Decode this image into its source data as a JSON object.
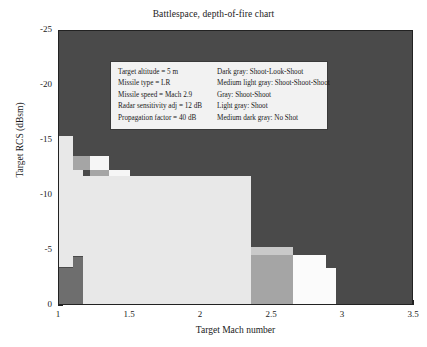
{
  "chart_data": {
    "type": "heatmap",
    "title": "Battlespace, depth-of-fire chart",
    "xlabel": "Target Mach number",
    "ylabel": "Target RCS (dBsm)",
    "xlim": [
      1,
      3.5
    ],
    "ylim": [
      -25,
      0
    ],
    "y_inverted": true,
    "grid": false,
    "xticks": [
      "1",
      "1.5",
      "2",
      "2.5",
      "3",
      "3.5"
    ],
    "xtick_values": [
      1,
      1.5,
      2,
      2.5,
      3,
      3.5
    ],
    "yticks": [
      "-25",
      "-20",
      "-15",
      "-10",
      "-5",
      "0"
    ],
    "ytick_values": [
      -25,
      -20,
      -15,
      -10,
      -5,
      0
    ],
    "legend_position": "upper-center-inside",
    "categories": [
      {
        "key": "shoot-look-shoot",
        "label": "Dark gray: Shoot-Look-Shoot",
        "color": "#4a4a4a"
      },
      {
        "key": "shoot-shoot-shoot",
        "label": "Medium light gray: Shoot-Shoot-Shoot",
        "color": "#c9c9c9"
      },
      {
        "key": "shoot-shoot",
        "label": "Gray: Shoot-Shoot",
        "color": "#a5a5a5"
      },
      {
        "key": "shoot",
        "label": "Light gray: Shoot",
        "color": "#e8e8e8"
      },
      {
        "key": "no-shot",
        "label": "Medium dark gray: No Shot",
        "color": "#6e6e6e"
      }
    ],
    "cells": [
      {
        "x0": 1.0,
        "x1": 1.1,
        "y0": -15.5,
        "y1": -13.6,
        "color": "#e8e8e8"
      },
      {
        "x0": 1.0,
        "x1": 1.1,
        "y0": -13.6,
        "y1": -3.5,
        "color": "#e8e8e8"
      },
      {
        "x0": 1.0,
        "x1": 1.1,
        "y0": -3.5,
        "y1": 0.0,
        "color": "#6e6e6e"
      },
      {
        "x0": 1.1,
        "x1": 1.17,
        "y0": -13.6,
        "y1": -4.5,
        "color": "#e8e8e8"
      },
      {
        "x0": 1.1,
        "x1": 1.17,
        "y0": -4.5,
        "y1": 0.0,
        "color": "#6e6e6e"
      },
      {
        "x0": 1.1,
        "x1": 1.22,
        "y0": -13.6,
        "y1": -12.4,
        "color": "#a5a5a5"
      },
      {
        "x0": 1.22,
        "x1": 1.35,
        "y0": -13.6,
        "y1": -12.4,
        "color": "#f6f6f6"
      },
      {
        "x0": 1.22,
        "x1": 1.35,
        "y0": -12.4,
        "y1": -11.2,
        "color": "#a5a5a5"
      },
      {
        "x0": 1.35,
        "x1": 1.5,
        "y0": -12.4,
        "y1": -11.2,
        "color": "#f6f6f6"
      },
      {
        "x0": 1.35,
        "x1": 1.5,
        "y0": -11.2,
        "y1": -10.0,
        "color": "#a5a5a5"
      },
      {
        "x0": 1.5,
        "x1": 1.66,
        "y0": -11.2,
        "y1": -10.0,
        "color": "#f6f6f6"
      },
      {
        "x0": 1.5,
        "x1": 1.66,
        "y0": -10.0,
        "y1": -8.9,
        "color": "#a5a5a5"
      },
      {
        "x0": 1.66,
        "x1": 1.84,
        "y0": -10.0,
        "y1": -8.9,
        "color": "#f6f6f6"
      },
      {
        "x0": 1.66,
        "x1": 1.84,
        "y0": -8.9,
        "y1": -7.7,
        "color": "#a5a5a5"
      },
      {
        "x0": 1.84,
        "x1": 2.03,
        "y0": -8.9,
        "y1": -7.7,
        "color": "#f6f6f6"
      },
      {
        "x0": 1.84,
        "x1": 2.03,
        "y0": -7.7,
        "y1": -6.5,
        "color": "#a5a5a5"
      },
      {
        "x0": 2.03,
        "x1": 2.22,
        "y0": -7.7,
        "y1": -6.5,
        "color": "#f6f6f6"
      },
      {
        "x0": 2.03,
        "x1": 2.22,
        "y0": -6.5,
        "y1": -5.4,
        "color": "#a5a5a5"
      },
      {
        "x0": 2.22,
        "x1": 2.35,
        "y0": -6.5,
        "y1": -5.4,
        "color": "#f6f6f6"
      },
      {
        "x0": 1.17,
        "x1": 2.35,
        "y0": -11.8,
        "y1": 0.0,
        "color": "#e8e8e8"
      },
      {
        "x0": 2.35,
        "x1": 2.65,
        "y0": -4.6,
        "y1": 0.0,
        "color": "#a5a5a5"
      },
      {
        "x0": 2.35,
        "x1": 2.65,
        "y0": -5.4,
        "y1": -4.6,
        "color": "#c9c9c9"
      },
      {
        "x0": 2.65,
        "x1": 2.88,
        "y0": -4.6,
        "y1": 0.0,
        "color": "#fbfbfb"
      },
      {
        "x0": 2.88,
        "x1": 2.95,
        "y0": -3.5,
        "y1": 0.0,
        "color": "#fbfbfb"
      }
    ]
  },
  "legend": {
    "params": [
      "Target altitude = 5 m",
      "Missile type = LR",
      "Missile speed = Mach 2.9",
      "Radar sensitivity adj = 12 dB",
      "Propagation factor = 40 dB"
    ],
    "key": [
      "Dark gray: Shoot-Look-Shoot",
      "Medium light gray: Shoot-Shoot-Shoot",
      "Gray: Shoot-Shoot",
      "Light gray: Shoot",
      "Medium dark gray: No Shot"
    ]
  }
}
